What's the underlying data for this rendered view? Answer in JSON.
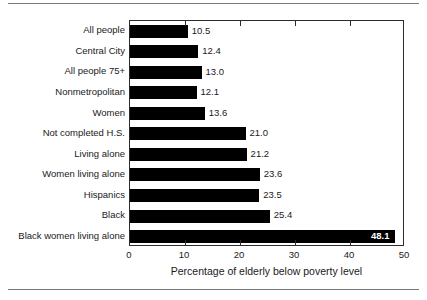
{
  "figure": {
    "background_color": "#ffffff",
    "rule_color": "#7a7a7a",
    "frame_color": "#2b2b2b",
    "bar_color": "#000000",
    "inside_label_color": "#ffffff"
  },
  "chart_data": {
    "type": "bar",
    "orientation": "horizontal",
    "title": "",
    "xlabel": "Percentage of elderly below poverty level",
    "ylabel": "",
    "xlim": [
      0,
      50
    ],
    "xticks": [
      0,
      10,
      20,
      30,
      40,
      50
    ],
    "xtick_labels": [
      "0",
      "10",
      "20",
      "30",
      "40",
      "50"
    ],
    "grid": false,
    "legend": false,
    "categories": [
      "All people",
      "Central City",
      "All people 75+",
      "Nonmetropolitan",
      "Women",
      "Not completed H.S.",
      "Living alone",
      "Women living alone",
      "Hispanics",
      "Black",
      "Black women living alone"
    ],
    "values": [
      10.5,
      12.4,
      13.0,
      12.1,
      13.6,
      21.0,
      21.2,
      23.6,
      23.5,
      25.4,
      48.1
    ],
    "value_labels": [
      "10.5",
      "12.4",
      "13.0",
      "12.1",
      "13.6",
      "21.0",
      "21.2",
      "23.6",
      "23.5",
      "25.4",
      "48.1"
    ],
    "value_label_placement": [
      "outside",
      "outside",
      "outside",
      "outside",
      "outside",
      "outside",
      "outside",
      "outside",
      "outside",
      "outside",
      "inside"
    ]
  }
}
